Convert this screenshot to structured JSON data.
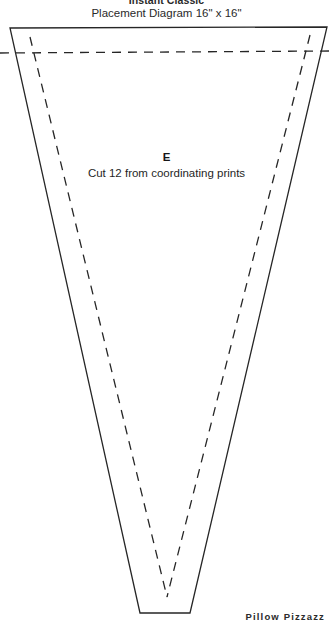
{
  "header": {
    "title": "Instant Classic",
    "subtitle_text": "Placement Diagram 16",
    "subtitle_unit_1": "\"",
    "subtitle_mid": " x 16",
    "subtitle_unit_2": "\"",
    "subtitle_full": "Placement Diagram 16\" x 16\""
  },
  "piece": {
    "letter": "E",
    "note": "Cut 12 from coordinating prints"
  },
  "brand": {
    "label": "Pillow Pizzazz"
  },
  "style": {
    "line_color": "#262626",
    "background": "#ffffff",
    "solid_width": "1.3",
    "dashed_width": "1.3",
    "dash_pattern": "9,7"
  },
  "geometry": {
    "cut_line": {
      "description": "solid cutting line of wedge template piece E",
      "points": "10,28 327,27 190,613 140,613"
    },
    "seam_line": {
      "description": "dashed stitching/seam line inside the wedge",
      "points": "30,37 310,35 167,597"
    },
    "seam_guide_horizontal": {
      "description": "dashed horizontal seam guide across full width",
      "x1": "0",
      "y1": "53",
      "x2": "333",
      "y2": "51"
    }
  }
}
